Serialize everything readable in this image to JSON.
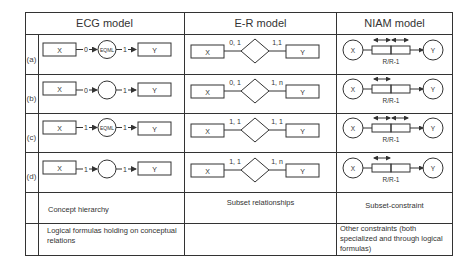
{
  "headers": {
    "ecg": "ECG model",
    "er": "E-R model",
    "niam": "NIAM model"
  },
  "rows": [
    {
      "label": "(a)",
      "ecg": {
        "left": "X",
        "card_left": "0",
        "node": "EQML",
        "card_right": "1",
        "right": "Y"
      },
      "er": {
        "left": "X",
        "card_left": "0, 1",
        "card_right": "1,1",
        "right": "Y"
      },
      "niam": {
        "left": "X",
        "right": "Y",
        "caption": "R/R-1",
        "arrows": "double-double"
      }
    },
    {
      "label": "(b)",
      "ecg": {
        "left": "X",
        "card_left": "0",
        "node": "",
        "card_right": "1",
        "right": "Y"
      },
      "er": {
        "left": "X",
        "card_left": "0, 1",
        "card_right": "1, n",
        "right": "Y"
      },
      "niam": {
        "left": "X",
        "right": "Y",
        "caption": "R/R-1",
        "arrows": "single-double"
      }
    },
    {
      "label": "(c)",
      "ecg": {
        "left": "X",
        "card_left": "1",
        "node": "EQML",
        "card_right": "1",
        "right": "Y"
      },
      "er": {
        "left": "X",
        "card_left": "1, 1",
        "card_right": "1, 1",
        "right": "Y"
      },
      "niam": {
        "left": "X",
        "right": "Y",
        "caption": "R/R-1",
        "arrows": "double-double"
      }
    },
    {
      "label": "(d)",
      "ecg": {
        "left": "X",
        "card_left": "1",
        "node": "",
        "card_right": "1",
        "right": "Y"
      },
      "er": {
        "left": "X",
        "card_left": "1, 1",
        "card_right": "1, n",
        "right": "Y"
      },
      "niam": {
        "left": "X",
        "right": "Y",
        "caption": "R/R-1",
        "arrows": "single-double"
      }
    }
  ],
  "footer_rows": [
    {
      "ecg": "Concept hierarchy",
      "er": "Subset relationships",
      "niam": "Subset-constraint"
    },
    {
      "ecg": "Logical formulas holding on conceptual relations",
      "er": "",
      "niam": "Other constraints (both specialized and through logical formulas)"
    }
  ]
}
